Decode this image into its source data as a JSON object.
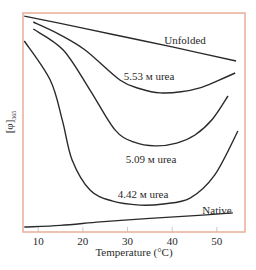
{
  "chart_data": {
    "type": "line",
    "title": "",
    "xlabel": "Temperature (°C)",
    "ylabel": "[φ]365",
    "ylabel_main": "[φ]",
    "ylabel_sub": "365",
    "xlim": [
      6.6,
      56.3
    ],
    "ylim": [
      0,
      100
    ],
    "y_units": "arbitrary (relative)",
    "x_ticks": [
      10,
      20,
      30,
      40,
      50
    ],
    "y_ticks": [],
    "grid": false,
    "legend": "inline labels",
    "frame_color": "#e8a78f",
    "line_color": "#2a2a2a",
    "series": [
      {
        "name": "Unfolded",
        "label": "Unfolded",
        "label_pos": [
          185,
          40
        ],
        "points": [
          [
            6.9,
            98.6
          ],
          [
            20,
            93.1
          ],
          [
            30,
            88.8
          ],
          [
            40,
            84.5
          ],
          [
            54.3,
            78.1
          ]
        ]
      },
      {
        "name": "5.53 M urea",
        "label": "5.53 м urea",
        "label_pos": [
          149,
          76
        ],
        "points": [
          [
            8.9,
            95.9
          ],
          [
            14.5,
            90.5
          ],
          [
            20.5,
            83.1
          ],
          [
            28.3,
            69.4
          ],
          [
            33,
            65.3
          ],
          [
            37.3,
            63.5
          ],
          [
            42,
            64.0
          ],
          [
            46.2,
            65.8
          ],
          [
            50,
            68.9
          ],
          [
            54.1,
            72.6
          ]
        ]
      },
      {
        "name": "5.09 M urea",
        "label": "5.09 м urea",
        "label_pos": [
          151,
          159
        ],
        "points": [
          [
            8.9,
            92.7
          ],
          [
            15.6,
            83.1
          ],
          [
            21.6,
            64.8
          ],
          [
            27.2,
            46.6
          ],
          [
            31.5,
            41.0
          ],
          [
            36.2,
            39.3
          ],
          [
            41,
            40.6
          ],
          [
            45.1,
            44.3
          ],
          [
            49,
            51.5
          ],
          [
            52.5,
            62.1
          ]
        ]
      },
      {
        "name": "4.42 M urea",
        "label": "4.42 м urea",
        "label_pos": [
          143,
          194
        ],
        "points": [
          [
            6.9,
            87.2
          ],
          [
            12.7,
            69.4
          ],
          [
            15.4,
            51.1
          ],
          [
            17.6,
            32.9
          ],
          [
            21.6,
            19.2
          ],
          [
            26.5,
            14.2
          ],
          [
            32.8,
            12.3
          ],
          [
            38,
            12.8
          ],
          [
            44.0,
            15.5
          ],
          [
            49.5,
            26.0
          ],
          [
            54.7,
            46.1
          ]
        ]
      },
      {
        "name": "Native",
        "label": "Native",
        "label_pos": [
          217,
          210
        ],
        "points": [
          [
            6.9,
            2.3
          ],
          [
            15,
            3.0
          ],
          [
            23.9,
            4.6
          ],
          [
            35,
            6.2
          ],
          [
            45,
            7.5
          ],
          [
            53.6,
            8.7
          ]
        ]
      }
    ]
  }
}
